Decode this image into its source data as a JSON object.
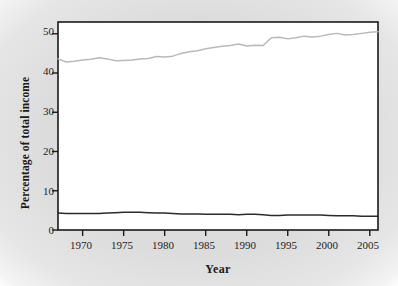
{
  "chart_data": {
    "type": "line",
    "title": "",
    "xlabel": "Year",
    "ylabel": "Percentage of total income",
    "xlim": [
      1967,
      2006
    ],
    "ylim": [
      0,
      53
    ],
    "grid": false,
    "legend_position": "inline-annotation",
    "xticks": [
      1970,
      1975,
      1980,
      1985,
      1990,
      1995,
      2000,
      2005
    ],
    "yticks": [
      0,
      10,
      20,
      30,
      40,
      50
    ],
    "x": [
      1967,
      1968,
      1969,
      1970,
      1971,
      1972,
      1973,
      1974,
      1975,
      1976,
      1977,
      1978,
      1979,
      1980,
      1981,
      1982,
      1983,
      1984,
      1985,
      1986,
      1987,
      1988,
      1989,
      1990,
      1991,
      1992,
      1993,
      1994,
      1995,
      1996,
      1997,
      1998,
      1999,
      2000,
      2001,
      2002,
      2003,
      2004,
      2005,
      2006
    ],
    "series": [
      {
        "name": "Top 20%",
        "label": "Top 20%",
        "color": "#b9b9b9",
        "values": [
          43.6,
          42.8,
          43.0,
          43.3,
          43.5,
          43.9,
          43.6,
          43.1,
          43.2,
          43.3,
          43.6,
          43.7,
          44.2,
          44.1,
          44.3,
          45.0,
          45.4,
          45.7,
          46.2,
          46.5,
          46.8,
          47.0,
          47.4,
          46.9,
          47.1,
          47.0,
          49.0,
          49.1,
          48.7,
          49.0,
          49.4,
          49.2,
          49.4,
          49.8,
          50.1,
          49.7,
          49.8,
          50.1,
          50.4,
          50.5
        ]
      },
      {
        "name": "Bottom 20%",
        "label": "Bottom 20%",
        "color": "#2b2b2b",
        "values": [
          4.3,
          4.2,
          4.2,
          4.2,
          4.2,
          4.2,
          4.3,
          4.4,
          4.5,
          4.5,
          4.5,
          4.4,
          4.3,
          4.3,
          4.2,
          4.1,
          4.1,
          4.1,
          4.0,
          4.0,
          4.0,
          4.0,
          3.9,
          4.0,
          4.0,
          3.9,
          3.7,
          3.7,
          3.8,
          3.8,
          3.8,
          3.8,
          3.8,
          3.7,
          3.6,
          3.6,
          3.6,
          3.5,
          3.5,
          3.5
        ]
      }
    ],
    "annotations": [
      {
        "text": "Top 20%",
        "x": 1989,
        "y": 51.0
      },
      {
        "text": "Bottom 20%",
        "x": 1988,
        "y": 8.5
      }
    ]
  },
  "axes": {
    "xlabel": "Year",
    "ylabel": "Percentage of total income",
    "ytick_labels": [
      "50",
      "40",
      "30",
      "20",
      "10",
      "0"
    ],
    "xtick_labels": [
      "1970",
      "1975",
      "1980",
      "1985",
      "1990",
      "1995",
      "2000",
      "2005"
    ]
  },
  "labels": {
    "top": "Top 20%",
    "bottom": "Bottom 20%"
  },
  "colors": {
    "top_series": "#b9b9b9",
    "bottom_series": "#2b2b2b",
    "frame": "#1a1a1a",
    "plot_background": "#ffffff",
    "page_background": "#dcdcdc"
  }
}
